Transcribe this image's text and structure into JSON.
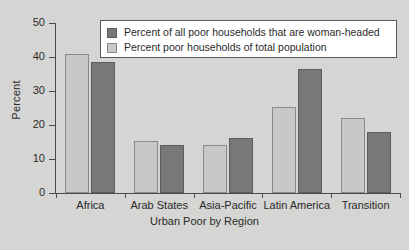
{
  "chart_data": {
    "type": "bar",
    "title": "",
    "xlabel": "Urban Poor by Region",
    "ylabel": "Percent",
    "ylim": [
      0,
      50
    ],
    "yticks": [
      0,
      10,
      20,
      30,
      40,
      50
    ],
    "grid": false,
    "legend_position": "top-right-inside",
    "categories": [
      "Africa",
      "Arab States",
      "Asia-Pacific",
      "Latin America",
      "Transition"
    ],
    "series": [
      {
        "name": "Percent of all poor households that are woman-headed",
        "color": "#787878",
        "draw_order": 2,
        "values": [
          38.5,
          14.0,
          16.1,
          36.6,
          17.8
        ]
      },
      {
        "name": "Percent poor households of total population",
        "color": "#c8c8c8",
        "draw_order": 1,
        "values": [
          40.9,
          15.3,
          14.2,
          25.3,
          22.0
        ]
      }
    ]
  },
  "legend": {
    "entries": [
      {
        "label": "Percent of all poor households that are woman-headed",
        "swatch": "dark"
      },
      {
        "label": "Percent poor households of total population",
        "swatch": "light"
      }
    ]
  },
  "colors": {
    "background": "#d5d5d3",
    "axis": "#4a4a4a",
    "series_dark": "#787878",
    "series_light": "#c8c8c8",
    "legend_background": "#ffffff"
  }
}
